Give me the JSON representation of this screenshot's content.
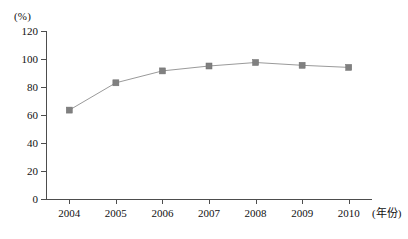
{
  "chart_data": {
    "type": "line",
    "title": "",
    "subtitle": "",
    "xlabel": "(年份)",
    "ylabel": "(%)",
    "categories": [
      "2004",
      "2005",
      "2006",
      "2007",
      "2008",
      "2009",
      "2010"
    ],
    "x": [
      2004,
      2005,
      2006,
      2007,
      2008,
      2009,
      2010
    ],
    "values": [
      63.5,
      83.0,
      91.5,
      95.0,
      97.5,
      95.5,
      94.0
    ],
    "series": [
      {
        "name": "",
        "values": [
          63.5,
          83.0,
          91.5,
          95.0,
          97.5,
          95.5,
          94.0
        ]
      }
    ],
    "ylim": [
      0,
      120
    ],
    "yticks": [
      0,
      20,
      40,
      60,
      80,
      100,
      120
    ],
    "ytick_labels": [
      "0",
      "20",
      "40",
      "60",
      "80",
      "100",
      "120"
    ],
    "xtick_labels": [
      "2004",
      "2005",
      "2006",
      "2007",
      "2008",
      "2009",
      "2010"
    ],
    "grid": false,
    "legend": false,
    "legend_position": "none",
    "marker": "square",
    "colors": {
      "line": "#9a9a9a",
      "marker": "#808080",
      "axis": "#4d4d4d",
      "text": "#111111",
      "background": "#ffffff"
    }
  }
}
